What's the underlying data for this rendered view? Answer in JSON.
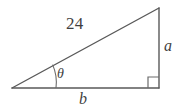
{
  "figure": {
    "type": "right-triangle-diagram",
    "background_color": "#ffffff",
    "stroke_color": "#595959",
    "text_color": "#3f3f3f",
    "labels": {
      "hypotenuse": "24",
      "vertical_leg": "a",
      "horizontal_leg": "b",
      "angle": "θ"
    },
    "markers": {
      "right_angle": "right-angle-square",
      "angle_arc": "angle-arc"
    },
    "geometry": {
      "vertex_left": [
        12,
        88
      ],
      "vertex_apex": [
        159,
        8
      ],
      "vertex_right": [
        159,
        88
      ],
      "right_angle_size": 11,
      "angle_arc_radius": 44
    }
  }
}
